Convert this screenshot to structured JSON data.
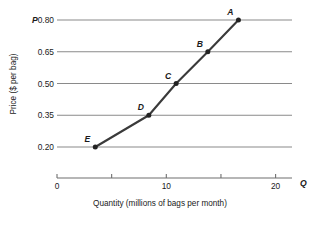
{
  "chart_data": {
    "type": "line",
    "title": "",
    "subtitle": "",
    "xlabel": "Quantity (millions of bags per month)",
    "ylabel": "Price ($ per bag)",
    "x_axis_symbol": "Q",
    "y_axis_symbol": "P",
    "xlim": [
      0,
      21.5
    ],
    "ylim": [
      0.125,
      0.86
    ],
    "grid": "horizontal",
    "legend": "none",
    "x_ticks": [
      0,
      5,
      10,
      15,
      20
    ],
    "x_tick_labels": [
      "0",
      "",
      "10",
      "",
      "20"
    ],
    "y_ticks": [
      0.2,
      0.35,
      0.5,
      0.65,
      0.8
    ],
    "y_tick_labels": [
      "0.20",
      "0.35",
      "0.50",
      "0.65",
      "0.80"
    ],
    "series": [
      {
        "name": "Supply",
        "x": [
          3.5,
          8.4,
          10.9,
          13.8,
          16.6
        ],
        "y": [
          0.2,
          0.35,
          0.5,
          0.65,
          0.8
        ],
        "point_labels": [
          "E",
          "D",
          "C",
          "B",
          "A"
        ],
        "color": "#3a3a3a"
      }
    ],
    "points": [
      {
        "label": "A",
        "quantity": 16.6,
        "price": 0.8
      },
      {
        "label": "B",
        "quantity": 13.8,
        "price": 0.65
      },
      {
        "label": "C",
        "quantity": 10.9,
        "price": 0.5
      },
      {
        "label": "D",
        "quantity": 8.4,
        "price": 0.35
      },
      {
        "label": "E",
        "quantity": 3.5,
        "price": 0.2
      }
    ]
  }
}
